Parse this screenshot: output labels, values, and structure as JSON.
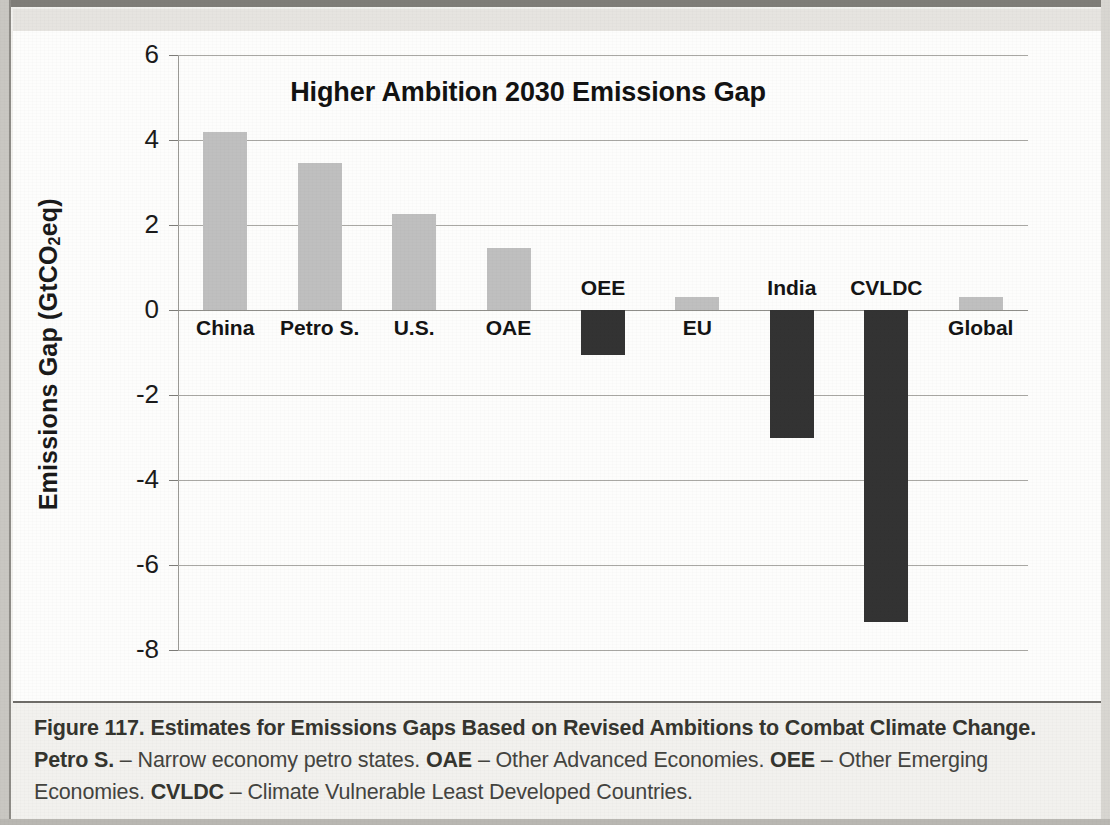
{
  "figure": {
    "caption_segments": [
      {
        "text": "Figure 117. Estimates for Emissions Gaps Based on Revised Ambitions to Combat Climate Change. Petro S.",
        "bold": true
      },
      {
        "text": " – Narrow economy petro states. ",
        "bold": false
      },
      {
        "text": "OAE",
        "bold": true
      },
      {
        "text": " – Other Advanced Economies. ",
        "bold": false
      },
      {
        "text": "OEE",
        "bold": true
      },
      {
        "text": " – Other Emerging Economies. ",
        "bold": false
      },
      {
        "text": "CVLDC",
        "bold": true
      },
      {
        "text": " – Climate Vulnerable Least Developed Countries.",
        "bold": false
      }
    ]
  },
  "chart_data": {
    "type": "bar",
    "title": "Higher Ambition 2030 Emissions Gap",
    "xlabel": "",
    "ylabel": "Emissions Gap (GtCO2eq)",
    "ylabel_rich": {
      "pre": "Emissions Gap (GtCO",
      "sub": "2",
      "post": "eq)"
    },
    "ylim": [
      -8,
      6
    ],
    "yticks": [
      6,
      4,
      2,
      0,
      -2,
      -4,
      -6,
      -8
    ],
    "ytick_labels": [
      "6",
      "4",
      "2",
      "0",
      "-2",
      "-4",
      "-6",
      "-8"
    ],
    "grid": true,
    "legend": "none",
    "categories": [
      "China",
      "Petro S.",
      "U.S.",
      "OAE",
      "OEE",
      "EU",
      "India",
      "CVLDC",
      "Global"
    ],
    "values": [
      4.2,
      3.45,
      2.25,
      1.45,
      -1.05,
      0.3,
      -3.0,
      -7.35,
      0.3
    ],
    "colors": {
      "positive_bar": "#bfbfbf",
      "negative_bar": "#333333",
      "gridline": "#a9a8a4",
      "text": "#141414"
    }
  }
}
